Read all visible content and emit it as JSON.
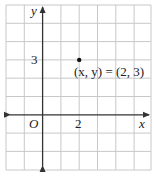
{
  "figure": {
    "axis_labels": {
      "x": "x",
      "y": "y",
      "origin": "O"
    },
    "tick_labels": {
      "x": "2",
      "y": "3"
    },
    "point": {
      "label": "(x, y) = (2, 3)",
      "x": 2,
      "y": 3
    },
    "grid": {
      "x_range": [
        -2,
        6
      ],
      "y_range": [
        -3,
        6
      ],
      "unit_px": 18.3
    },
    "colors": {
      "grid": "#c8c8c8",
      "axis": "#333333",
      "point": "#111111",
      "background": "#ffffff"
    }
  }
}
